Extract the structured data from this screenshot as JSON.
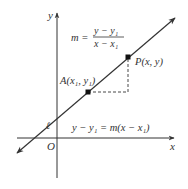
{
  "diagram": {
    "axes": {
      "x_label": "x",
      "y_label": "y",
      "origin_label": "O"
    },
    "line_label": "ℓ",
    "slope_formula": {
      "lhs": "m =",
      "numerator": "y − y₁",
      "denominator": "x − x₁"
    },
    "point_a": {
      "label": "A(x₁, y₁)"
    },
    "point_p": {
      "label": "P(x, y)"
    },
    "equation": "y − y₁ = m(x − x₁)",
    "colors": {
      "line": "#333333",
      "text": "#333333",
      "background": "#ffffff"
    }
  }
}
